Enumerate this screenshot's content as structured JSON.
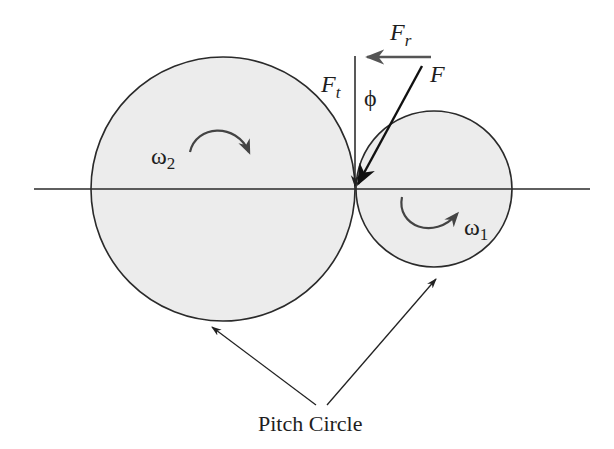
{
  "diagram": {
    "colors": {
      "background": "#ffffff",
      "gear_fill": "#ececec",
      "stroke": "#2a2a2a",
      "force_arrow": "#111111",
      "radial_arrow": "#555555",
      "rotation_arrow": "#444444",
      "text": "#1e1e1e"
    },
    "gears": [
      {
        "id": "gear-2",
        "label": "pitch circle (large gear)",
        "cx": 223,
        "cy": 189,
        "r": 132,
        "omega_symbol": "ω",
        "omega_sub": "2",
        "rotation": "clockwise"
      },
      {
        "id": "gear-1",
        "label": "pitch circle (small gear)",
        "cx": 434,
        "cy": 189,
        "r": 78,
        "omega_symbol": "ω",
        "omega_sub": "1",
        "rotation": "counter-clockwise"
      }
    ],
    "center_line": {
      "x1": 34,
      "y1": 189,
      "x2": 590,
      "y2": 189
    },
    "contact_point": {
      "x": 355,
      "y": 189
    },
    "forces": {
      "Ft": {
        "main": "F",
        "sub": "t",
        "description": "tangential force"
      },
      "Fr": {
        "main": "F",
        "sub": "r",
        "description": "radial force"
      },
      "F": {
        "main": "F",
        "description": "resultant force"
      },
      "phi": {
        "symbol": "ϕ",
        "description": "pressure angle"
      }
    },
    "callout": {
      "text": "Pitch Circle"
    }
  }
}
